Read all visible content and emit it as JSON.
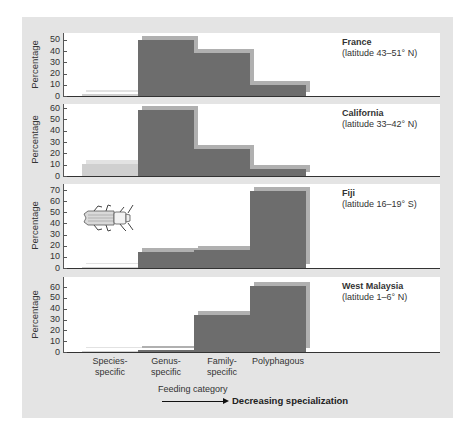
{
  "chart_data": {
    "type": "bar",
    "categories": [
      "Species-specific",
      "Genus-specific",
      "Family-specific",
      "Polyphagous"
    ],
    "xlabel": "Feeding category",
    "ylabel": "Percentage",
    "annotation": "Decreasing specialization",
    "panels": [
      {
        "name": "France",
        "subtitle": "(latitude 43–51° N)",
        "ylim": [
          0,
          50
        ],
        "yticks": [
          0,
          10,
          20,
          30,
          40,
          50
        ],
        "values": [
          2,
          50,
          38,
          10
        ]
      },
      {
        "name": "California",
        "subtitle": "(latitude 33–42° N)",
        "ylim": [
          0,
          60
        ],
        "yticks": [
          0,
          10,
          20,
          30,
          40,
          50,
          60
        ],
        "values": [
          11,
          58,
          24,
          6
        ]
      },
      {
        "name": "Fiji",
        "subtitle": "(latitude 16–19° S)",
        "ylim": [
          0,
          70
        ],
        "yticks": [
          0,
          10,
          20,
          30,
          40,
          50,
          60,
          70
        ],
        "values": [
          1,
          14,
          16,
          69
        ]
      },
      {
        "name": "West Malaysia",
        "subtitle": "(latitude 1–6° N)",
        "ylim": [
          0,
          60
        ],
        "yticks": [
          0,
          10,
          20,
          30,
          40,
          50,
          60
        ],
        "values": [
          0,
          2,
          34,
          61
        ]
      }
    ]
  },
  "labels": {
    "categories": [
      {
        "line1": "Species-",
        "line2": "specific"
      },
      {
        "line1": "Genus-",
        "line2": "specific"
      },
      {
        "line1": "Family-",
        "line2": "specific"
      },
      {
        "line1": "Polyphagous",
        "line2": ""
      }
    ],
    "xtitle": "Feeding category",
    "arrow_text": "Decreasing specialization",
    "ylabel": "Percentage"
  },
  "colors": {
    "bar": "#6d6d6d",
    "bar_shadow": "#b0b0b0",
    "species_bar": "#cfcfcf",
    "frame": "#e4e4e4"
  },
  "icon": "beetle-icon"
}
